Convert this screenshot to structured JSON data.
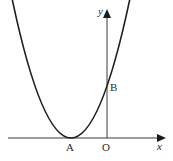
{
  "diagram": {
    "type": "parabola-graph",
    "labels": {
      "y_axis": "y",
      "x_axis": "x",
      "vertex": "A",
      "origin": "O",
      "y_intercept": "B"
    },
    "colors": {
      "curve": "#1e1e1e",
      "axis": "#3a3a3a",
      "text": "#2a2a2a"
    }
  }
}
